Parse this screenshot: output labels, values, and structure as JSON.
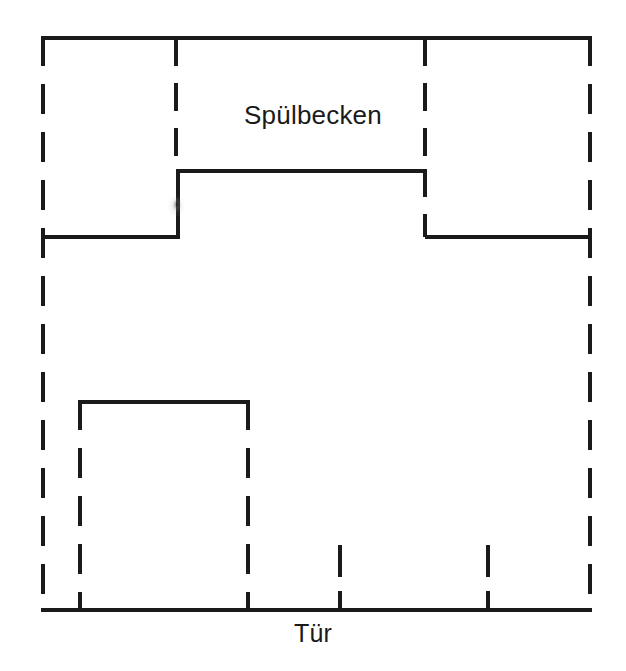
{
  "diagram": {
    "kind": "floor-plan",
    "background_color": "#ffffff",
    "line_color": "#1a1a1a",
    "canvas": {
      "width": 626,
      "height": 671
    },
    "labels": {
      "sink": "Spülbecken",
      "door": "Tür"
    },
    "elements": {
      "outer_room": {
        "name": "room-outline",
        "x1": 41,
        "y1": 36,
        "x2": 592,
        "y2": 612,
        "stroke_style": "dashed",
        "stroke_width": 4
      },
      "left_partition": {
        "name": "left-partition-wall",
        "x": 176,
        "y1": 36,
        "y2": 169,
        "stroke_style": "dashed"
      },
      "right_partition": {
        "name": "right-partition-wall",
        "x": 425,
        "y1": 36,
        "y2": 237,
        "stroke_style": "dashed"
      },
      "counter_top_edge": {
        "name": "counter-front-edge",
        "x1": 176,
        "x2": 425,
        "y": 169,
        "stroke_style": "solid"
      },
      "counter_left_return": {
        "name": "counter-left-return",
        "x": 176,
        "y1": 169,
        "y2": 237,
        "stroke_style": "solid"
      },
      "left_counter_edge": {
        "name": "left-counter-edge",
        "x1": 41,
        "x2": 176,
        "y": 237,
        "stroke_style": "solid"
      },
      "right_counter_edge": {
        "name": "right-counter-edge",
        "x1": 425,
        "x2": 592,
        "y": 237,
        "stroke_style": "solid"
      },
      "island_unit": {
        "name": "lower-cabinet-block",
        "x1": 78,
        "y1": 400,
        "x2": 250,
        "y2": 612,
        "top_stroke_style": "solid",
        "side_stroke_style": "dashed"
      },
      "tick_marks": [
        {
          "name": "cabinet-divider-tick-1",
          "x": 340,
          "y1": 545,
          "y2": 612
        },
        {
          "name": "cabinet-divider-tick-2",
          "x": 488,
          "y1": 545,
          "y2": 612
        }
      ],
      "artifact": {
        "name": "scan-smudge",
        "x": 176,
        "y": 205
      }
    }
  }
}
